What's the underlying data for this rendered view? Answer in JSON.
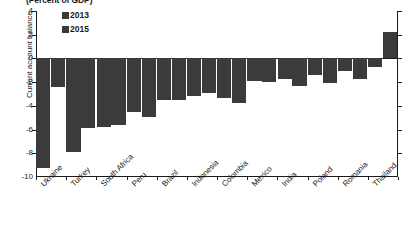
{
  "chart_data": {
    "type": "bar",
    "title": "(Percent of GDP)",
    "xlabel": "",
    "ylabel": "Current account balance",
    "ylim": [
      -10,
      4
    ],
    "yticks": [
      4,
      2,
      0,
      -2,
      -4,
      -6,
      -8,
      -10
    ],
    "ytick_labels": [
      "4",
      "2",
      "0",
      "-2",
      "-4",
      "-6",
      "-8",
      "-10"
    ],
    "grid": false,
    "legend_position": "top-left",
    "categories": [
      "Ukraine",
      "Turkey",
      "South Africa",
      "Peru",
      "Brazil",
      "Indonesia",
      "Colombia",
      "Mexico",
      "India",
      "Poland",
      "Romania",
      "Thailand"
    ],
    "series": [
      {
        "name": "2013",
        "color": "#3b3b3b",
        "values": [
          -9.2,
          -7.9,
          -5.8,
          -4.5,
          -3.5,
          -3.2,
          -3.3,
          -1.9,
          -1.7,
          -1.4,
          -1.1,
          -0.7
        ]
      },
      {
        "name": "2015",
        "color": "#3b3b3b",
        "values": [
          -2.4,
          -5.9,
          -5.6,
          -4.9,
          -3.5,
          -2.9,
          -3.8,
          -2.0,
          -2.3,
          -2.1,
          -1.7,
          2.2
        ]
      }
    ]
  },
  "legend": {
    "items": [
      {
        "label": "2013",
        "color": "#3b3b3b"
      },
      {
        "label": "2015",
        "color": "#3b3b3b"
      }
    ]
  },
  "axis": {
    "y_title": "Current account balance",
    "title_text": "(Percent of GDP)"
  }
}
